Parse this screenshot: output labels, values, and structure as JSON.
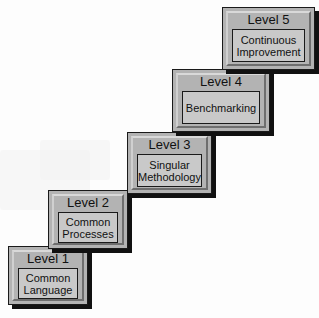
{
  "diagram": {
    "type": "staircase",
    "steps": [
      {
        "level": "Level 1",
        "name": "Common Language",
        "line1": "Common",
        "line2": "Language"
      },
      {
        "level": "Level 2",
        "name": "Common Processes",
        "line1": "Common",
        "line2": "Processes"
      },
      {
        "level": "Level 3",
        "name": "Singular Methodology",
        "line1": "Singular",
        "line2": "Methodology"
      },
      {
        "level": "Level 4",
        "name": "Benchmarking",
        "line1": "Benchmarking",
        "line2": ""
      },
      {
        "level": "Level 5",
        "name": "Continuous Improvement",
        "line1": "Continuous",
        "line2": "Improvement"
      }
    ],
    "colors": {
      "box": "#b3b3b3",
      "inner": "#c9c9c9",
      "shadow": "#111111",
      "background": "#fdfdfd"
    }
  }
}
